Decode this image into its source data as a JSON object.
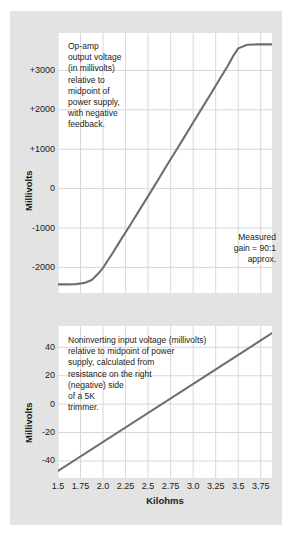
{
  "figure": {
    "background_color": "#e3e3e3",
    "plot_background_color": "#ffffff",
    "grid_color": "#d8d8d8",
    "line_color": "#6e6e6e"
  },
  "top": {
    "y_title": "Millivolts",
    "y_ticks": [
      "+3000",
      "+2000",
      "+1000",
      "0",
      "-1000",
      "-2000"
    ],
    "annotation_main": "Op-amp\noutput voltage\n(in millivolts)\nrelative to\nmidpoint of\npower supply,\nwith negative\nfeedback.",
    "annotation_gain": "Measured\ngain = 90:1\napprox."
  },
  "bottom": {
    "y_title": "Millivolts",
    "y_ticks": [
      "40",
      "20",
      "0",
      "-20",
      "-40"
    ],
    "annotation_main": "Noninverting input voltage (millivolts)\nrelative to midpoint of power\nsupply, calculated from\nresistance on the right\n(negative) side\nof a 5K\ntrimmer."
  },
  "x_axis": {
    "title": "Kilohms",
    "ticks": [
      "1.5",
      "1.75",
      "2.0",
      "2.25",
      "2.5",
      "2.75",
      "3.0",
      "3.25",
      "3.5",
      "3.75"
    ]
  },
  "chart_data": [
    {
      "type": "line",
      "title": "Op-amp output voltage (in millivolts) relative to midpoint of power supply, with negative feedback.",
      "xlabel": "Kilohms",
      "ylabel": "Millivolts",
      "xlim": [
        1.5,
        3.875
      ],
      "ylim": [
        -2650,
        3950
      ],
      "xticks": [
        1.5,
        1.75,
        2.0,
        2.25,
        2.5,
        2.75,
        3.0,
        3.25,
        3.5,
        3.75
      ],
      "yticks": [
        3000,
        2000,
        1000,
        0,
        -1000,
        -2000
      ],
      "grid": true,
      "legend": "none",
      "annotations": [
        "Op-amp output voltage (in millivolts) relative to midpoint of power supply, with negative feedback.",
        "Measured gain = 90:1 approx."
      ],
      "x": [
        1.5,
        1.6,
        1.7,
        1.8,
        1.875,
        1.95,
        2.0,
        2.1,
        2.2,
        2.3,
        2.4,
        2.5,
        2.6,
        2.7,
        2.8,
        2.9,
        3.0,
        3.1,
        3.2,
        3.3,
        3.38,
        3.44,
        3.5,
        3.6,
        3.7,
        3.875
      ],
      "y": [
        -2430,
        -2430,
        -2425,
        -2390,
        -2320,
        -2150,
        -2010,
        -1660,
        -1290,
        -930,
        -560,
        -190,
        180,
        560,
        930,
        1300,
        1680,
        2050,
        2420,
        2800,
        3100,
        3350,
        3560,
        3650,
        3660,
        3660
      ]
    },
    {
      "type": "line",
      "title": "Noninverting input voltage (millivolts) relative to midpoint of power supply, calculated from resistance on the right (negative) side of a 5K trimmer.",
      "xlabel": "Kilohms",
      "ylabel": "Millivolts",
      "xlim": [
        1.5,
        3.875
      ],
      "ylim": [
        -52,
        55
      ],
      "xticks": [
        1.5,
        1.75,
        2.0,
        2.25,
        2.5,
        2.75,
        3.0,
        3.25,
        3.5,
        3.75
      ],
      "yticks": [
        40,
        20,
        0,
        -20,
        -40
      ],
      "grid": true,
      "legend": "none",
      "annotations": [
        "Noninverting input voltage (millivolts) relative to midpoint of power supply, calculated from resistance on the right (negative) side of a 5K trimmer."
      ],
      "x": [
        1.5,
        3.875
      ],
      "y": [
        -47,
        50
      ]
    }
  ]
}
